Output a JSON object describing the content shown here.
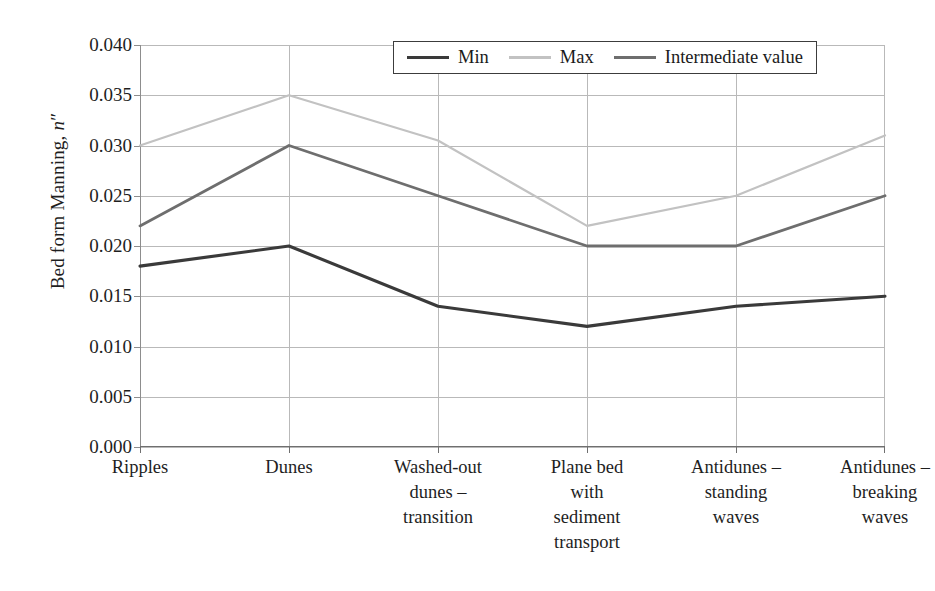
{
  "chart_data": {
    "type": "line",
    "title": "",
    "xlabel": "",
    "ylabel": "Bed form Manning, n″",
    "ylabel_prefix": "Bed form Manning, ",
    "ylabel_symbol": "n",
    "ylabel_suffix": "″",
    "categories": [
      "Ripples",
      "Dunes",
      "Washed-out dunes – transition",
      "Plane bed with sediment transport",
      "Antidunes – standing waves",
      "Antidunes – breaking waves"
    ],
    "category_lines": [
      [
        "Ripples"
      ],
      [
        "Dunes"
      ],
      [
        "Washed-out",
        "dunes –",
        "transition"
      ],
      [
        "Plane bed",
        "with",
        "sediment",
        "transport"
      ],
      [
        "Antidunes –",
        "standing",
        "waves"
      ],
      [
        "Antidunes –",
        "breaking",
        "waves"
      ]
    ],
    "series": [
      {
        "name": "Min",
        "color": "#3a3a3a",
        "width": 3.1,
        "values": [
          0.018,
          0.02,
          0.014,
          0.012,
          0.014,
          0.015
        ]
      },
      {
        "name": "Max",
        "color": "#c2c2c2",
        "width": 2.2,
        "values": [
          0.03,
          0.035,
          0.0305,
          0.022,
          0.025,
          0.031
        ]
      },
      {
        "name": "Intermediate value",
        "color": "#6e6e6e",
        "width": 2.8,
        "values": [
          0.022,
          0.03,
          0.025,
          0.02,
          0.02,
          0.025
        ]
      }
    ],
    "ylim": [
      0.0,
      0.04
    ],
    "ytick_values": [
      0.04,
      0.035,
      0.03,
      0.025,
      0.02,
      0.015,
      0.01,
      0.005,
      0.0
    ],
    "ytick_labels": [
      "0.040",
      "0.035",
      "0.030",
      "0.025",
      "0.020",
      "0.015",
      "0.010",
      "0.005",
      "0.000"
    ],
    "grid": "horizontal-and-vertical",
    "legend_position": "top-center",
    "legend_entries": [
      "Min",
      "Max",
      "Intermediate value"
    ],
    "colors": {
      "min": "#3a3a3a",
      "max": "#c2c2c2",
      "intermediate": "#6e6e6e",
      "grid": "#b9b9b9",
      "axis": "#6f6f6f",
      "text": "#1e1e1e",
      "background": "#ffffff"
    }
  }
}
